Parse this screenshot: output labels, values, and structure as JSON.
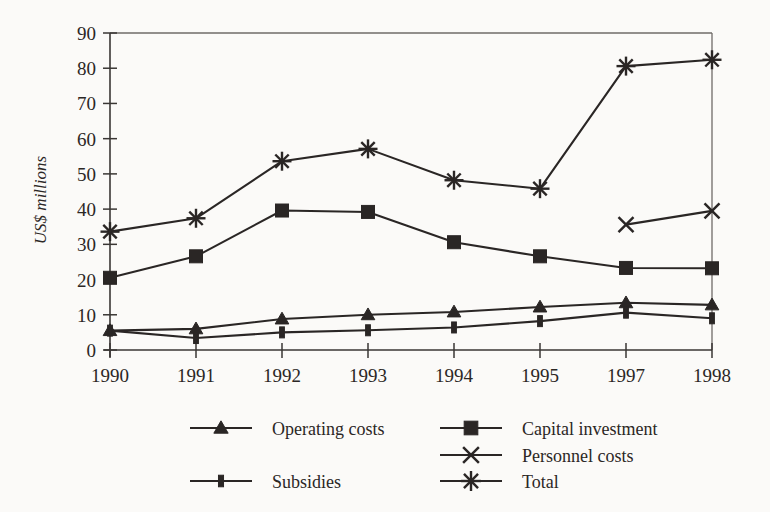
{
  "chart_data": {
    "type": "line",
    "title": "",
    "xlabel": "",
    "ylabel": "US$ millions",
    "ylim": [
      0,
      90
    ],
    "ytick_step": 10,
    "yticks": [
      0,
      10,
      20,
      30,
      40,
      50,
      60,
      70,
      80,
      90
    ],
    "grid": false,
    "legend_position": "bottom",
    "categories": [
      "1990",
      "1991",
      "1992",
      "1993",
      "1994",
      "1995",
      "1997",
      "1998"
    ],
    "series": [
      {
        "name": "Operating costs",
        "marker": "triangle",
        "values": [
          5.5,
          6.0,
          8.8,
          10.0,
          10.8,
          12.2,
          13.4,
          12.8
        ]
      },
      {
        "name": "Capital investment",
        "marker": "square",
        "values": [
          20.5,
          26.6,
          39.6,
          39.2,
          30.6,
          26.6,
          23.3,
          23.2
        ]
      },
      {
        "name": "Personnel costs",
        "marker": "cross",
        "values": [
          null,
          null,
          null,
          null,
          null,
          null,
          35.6,
          39.5
        ]
      },
      {
        "name": "Total",
        "marker": "asterisk",
        "values": [
          33.6,
          37.4,
          53.6,
          57.1,
          48.2,
          45.8,
          80.6,
          82.4
        ]
      },
      {
        "name": "Subsidies",
        "marker": "vbar",
        "values": [
          5.5,
          3.4,
          5.0,
          5.6,
          6.4,
          8.2,
          10.6,
          9.0
        ]
      }
    ]
  },
  "axis": {
    "y_title": "US$ millions",
    "y_labels": [
      "90",
      "80",
      "70",
      "60",
      "50",
      "40",
      "30",
      "20",
      "10",
      "0"
    ],
    "x_labels": [
      "1990",
      "1991",
      "1992",
      "1993",
      "1994",
      "1995",
      "1997",
      "1998"
    ]
  },
  "legend": {
    "column_left": [
      {
        "label": "Operating costs",
        "marker": "triangle-marker"
      },
      {
        "label": "Subsidies",
        "marker": "vbar-marker"
      }
    ],
    "column_right": [
      {
        "label": "Capital investment",
        "marker": "square-marker"
      },
      {
        "label": "Personnel costs",
        "marker": "cross-marker"
      },
      {
        "label": "Total",
        "marker": "asterisk-marker"
      }
    ]
  },
  "colors": {
    "ink": "#2a2625",
    "frame": "#6f6b68",
    "background": "#fbfaf8"
  }
}
